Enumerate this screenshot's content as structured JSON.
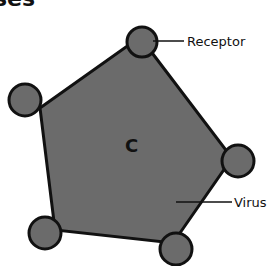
{
  "title": "ses",
  "diagram": {
    "center_label": "C",
    "labels": {
      "receptor": "Receptor",
      "virus": "Virus"
    },
    "colors": {
      "fill": "#6b6b6b",
      "stroke": "#111111",
      "background": "#ffffff"
    }
  }
}
